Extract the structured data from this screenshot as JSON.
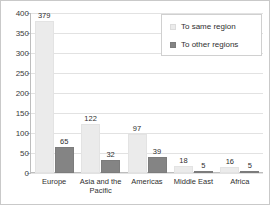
{
  "chart_data": {
    "type": "bar",
    "title": "",
    "xlabel": "",
    "ylabel": "",
    "ylim": [
      0,
      400
    ],
    "ytick_step": 50,
    "yticks": [
      "0",
      "50",
      "100",
      "150",
      "200",
      "250",
      "300",
      "350",
      "400"
    ],
    "grid": true,
    "legend_position": "top-right",
    "categories": [
      "Europe",
      "Asia and the Pacific",
      "Americas",
      "Middle East",
      "Africa"
    ],
    "category_lines": [
      [
        "Europe"
      ],
      [
        "Asia and the",
        "Pacific"
      ],
      [
        "Americas"
      ],
      [
        "Middle East"
      ],
      [
        "Africa"
      ]
    ],
    "series": [
      {
        "name": "To same region",
        "color": "#ebebeb",
        "values": [
          379,
          122,
          97,
          18,
          16
        ]
      },
      {
        "name": "To other regions",
        "color": "#848484",
        "values": [
          65,
          32,
          39,
          5,
          5
        ]
      }
    ]
  },
  "legend": {
    "items": [
      {
        "label": "To same region",
        "swatch": "legend-swatch-light"
      },
      {
        "label": "To other regions",
        "swatch": "legend-swatch-dark"
      }
    ]
  },
  "colors": {
    "series_same": "#ebebeb",
    "series_other": "#848484",
    "gridline": "#e2e2e2",
    "axis": "#bdbdbd",
    "text": "#2f2f2f",
    "frame_border": "#c9c9c9"
  }
}
